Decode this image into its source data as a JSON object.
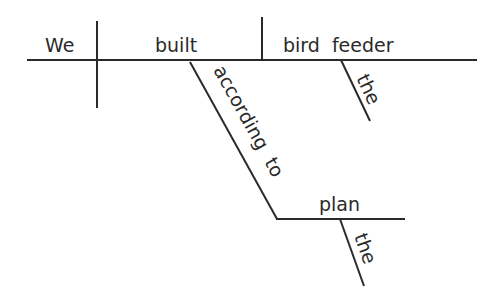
{
  "diagram": {
    "type": "sentence-diagram",
    "sentence": "We built the bird feeder according to the plan",
    "subject": "We",
    "verb": "built",
    "direct_object": "bird feeder",
    "object_modifier": "the",
    "preposition": "according to",
    "prepositional_object": "plan",
    "prepositional_object_modifier": "the"
  }
}
